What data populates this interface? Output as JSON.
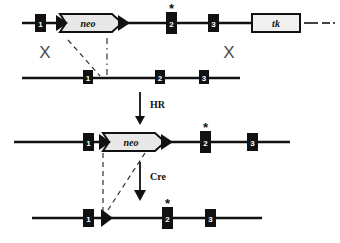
{
  "figure": {
    "background_color": "#ffffff",
    "line_color": "#111111",
    "box_fill": "#111111",
    "box_label_color": "#ffffff",
    "cassette_fill": "#e8e8e8",
    "xmark_color": "#4a4a4a"
  },
  "rows": [
    {
      "id": "targeting-vector",
      "y": 23,
      "line": {
        "x1": 22,
        "x2": 300
      },
      "tail_dashes": [
        {
          "x1": 304,
          "x2": 318
        },
        {
          "x1": 322,
          "x2": 330
        },
        {
          "x1": 333,
          "x2": 335
        }
      ],
      "exons": [
        {
          "label": "1",
          "x": 35,
          "star": false
        },
        {
          "label": "2",
          "x": 166,
          "star": true
        },
        {
          "label": "3",
          "x": 208,
          "star": false
        }
      ],
      "cassettes": [
        {
          "label": "neo",
          "x": 60,
          "width": 62,
          "shape": "arrow"
        },
        {
          "label": "tk",
          "x": 252,
          "width": 48,
          "shape": "box"
        }
      ],
      "loxp": [
        {
          "x": 60
        },
        {
          "x": 122
        }
      ]
    },
    {
      "id": "endogenous-locus",
      "y": 78,
      "line": {
        "x1": 22,
        "x2": 240
      },
      "exons": [
        {
          "label": "1",
          "x": 83,
          "star": false
        },
        {
          "label": "2",
          "x": 155,
          "star": false
        },
        {
          "label": "3",
          "x": 199,
          "star": false
        }
      ],
      "cassettes": [],
      "loxp": []
    },
    {
      "id": "targeted-allele",
      "y": 142,
      "line": {
        "x1": 14,
        "x2": 290
      },
      "exons": [
        {
          "label": "1",
          "x": 83,
          "star": false
        },
        {
          "label": "2",
          "x": 200,
          "star": true
        },
        {
          "label": "3",
          "x": 247,
          "star": false
        }
      ],
      "cassettes": [
        {
          "label": "neo",
          "x": 103,
          "width": 62,
          "shape": "arrow"
        }
      ],
      "loxp": [
        {
          "x": 103
        },
        {
          "x": 165
        }
      ]
    },
    {
      "id": "floxed-deleted-allele",
      "y": 218,
      "line": {
        "x1": 32,
        "x2": 262
      },
      "exons": [
        {
          "label": "1",
          "x": 83,
          "star": false
        },
        {
          "label": "2",
          "x": 162,
          "star": true
        },
        {
          "label": "3",
          "x": 205,
          "star": false
        }
      ],
      "cassettes": [],
      "loxp": [
        {
          "x": 103
        }
      ]
    }
  ],
  "crossovers": [
    {
      "name": "left-crossover",
      "label": "X",
      "x": 45,
      "y": 58
    },
    {
      "name": "right-crossover",
      "label": "X",
      "x": 229,
      "y": 58
    }
  ],
  "steps": [
    {
      "name": "homologous-recombination",
      "label": "HR",
      "x": 152,
      "y": 112,
      "arrow_x": 140,
      "arrow_y1": 92,
      "arrow_y2": 122
    },
    {
      "name": "cre-recombination",
      "label": "Cre",
      "x": 152,
      "y": 182,
      "arrow_x": 140,
      "arrow_y1": 162,
      "arrow_y2": 198
    }
  ],
  "guides": [
    {
      "name": "guide-dash-diagonal-upper",
      "x1": 68,
      "y1": 40,
      "x2": 100,
      "y2": 76,
      "style": "dashed"
    },
    {
      "name": "guide-dashdot-vertical-upper",
      "x1": 107,
      "y1": 38,
      "x2": 107,
      "y2": 76,
      "style": "dashdot"
    },
    {
      "name": "guide-dashed-vertical-lower",
      "x1": 103,
      "y1": 152,
      "x2": 103,
      "y2": 214,
      "style": "dashed"
    },
    {
      "name": "guide-dashed-diagonal-lower",
      "x1": 145,
      "y1": 152,
      "x2": 106,
      "y2": 212,
      "style": "dashed"
    }
  ]
}
